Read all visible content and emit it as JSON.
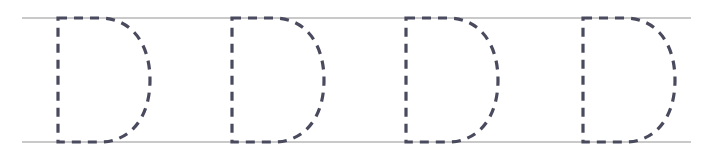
{
  "worksheet": {
    "title": "Letter D Tracing Practice Row",
    "letter": "D",
    "letter_case": "uppercase",
    "repetitions": 4,
    "canvas": {
      "width": 711,
      "height": 160,
      "background": "#ffffff"
    },
    "guide_lines": {
      "name": "writing-guide-rules",
      "color": "#c9c9c9",
      "stroke_width": 1.4,
      "x_start": 22,
      "x_end": 691,
      "top_y": 18,
      "bottom_y": 142,
      "count": 2,
      "labels": [
        "top-rule",
        "baseline-rule"
      ]
    },
    "stroke_style": {
      "color": "#4a4a5e",
      "stroke_width": 3.2,
      "dash_pattern": "9 7",
      "dash_array": [
        9,
        7
      ],
      "style_name": "dashed-trace-outline"
    },
    "letters": [
      {
        "index": 1,
        "name": "trace-letter-d-1",
        "stem_x": 58,
        "top_y": 18,
        "bottom_y": 142,
        "bowl_right_x": 150,
        "path": "M 58 18 L 100 18 C 130 18 150 42 150 80 C 150 118 130 142 100 142 L 58 142 L 58 18 Z"
      },
      {
        "index": 2,
        "name": "trace-letter-d-2",
        "stem_x": 232,
        "top_y": 18,
        "bottom_y": 142,
        "bowl_right_x": 324,
        "path": "M 232 18 L 274 18 C 304 18 324 42 324 80 C 324 118 304 142 274 142 L 232 142 L 232 18 Z"
      },
      {
        "index": 3,
        "name": "trace-letter-d-3",
        "stem_x": 406,
        "top_y": 18,
        "bottom_y": 142,
        "bowl_right_x": 498,
        "path": "M 406 18 L 448 18 C 478 18 498 42 498 80 C 498 118 478 142 448 142 L 406 142 L 406 18 Z"
      },
      {
        "index": 4,
        "name": "trace-letter-d-4",
        "stem_x": 583,
        "top_y": 18,
        "bottom_y": 142,
        "bowl_right_x": 675,
        "path": "M 583 18 L 625 18 C 655 18 675 42 675 80 C 675 118 655 142 625 142 L 583 142 L 583 18 Z"
      }
    ]
  }
}
